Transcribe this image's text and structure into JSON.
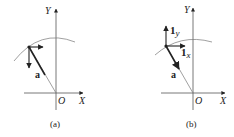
{
  "figures": [
    {
      "id": "a",
      "caption": "(a)",
      "axis_x_label": "X",
      "axis_y_label": "Y",
      "origin_label": "O",
      "vector_label": "a",
      "unit_labels": []
    },
    {
      "id": "b",
      "caption": "(b)",
      "axis_x_label": "X",
      "axis_y_label": "Y",
      "origin_label": "O",
      "vector_label": "a",
      "unit_labels": [
        "1",
        "y",
        "1",
        "x"
      ]
    }
  ],
  "colors": {
    "line": "#222222",
    "axis": "#555555",
    "arc": "#777777"
  }
}
